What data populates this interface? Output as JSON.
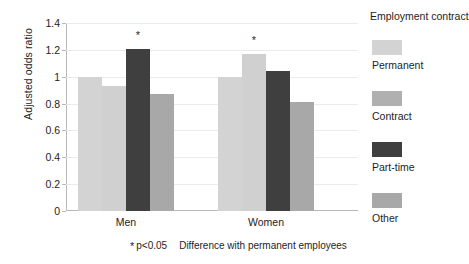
{
  "chart_data": {
    "type": "bar",
    "title": "",
    "xlabel": "",
    "ylabel": "Adjusted odds ratio",
    "ylim": [
      0,
      1.4
    ],
    "yticks": [
      "0",
      "0.2",
      "0.4",
      "0.6",
      "0.8",
      "1",
      "1.2",
      "1.4"
    ],
    "ytick_values": [
      0,
      0.2,
      0.4,
      0.6,
      0.8,
      1.0,
      1.2,
      1.4
    ],
    "grid": true,
    "legend_position": "right",
    "legend_title": "Employment contract",
    "categories": [
      "Men",
      "Women"
    ],
    "series": [
      {
        "name": "Permanent",
        "color": "#d3d3d3",
        "values": [
          1.0,
          1.0
        ],
        "significant": [
          false,
          false
        ]
      },
      {
        "name": "Contract",
        "color": "#d0d0d0",
        "values": [
          0.93,
          1.17
        ],
        "significant": [
          false,
          true
        ]
      },
      {
        "name": "Part-time",
        "color": "#3f3f3f",
        "values": [
          1.21,
          1.04
        ],
        "significant": [
          true,
          false
        ]
      },
      {
        "name": "Other",
        "color": "#a8a8a8",
        "values": [
          0.87,
          0.81
        ],
        "significant": [
          false,
          false
        ]
      }
    ],
    "significance_marker": "*",
    "footnote_marker": "*",
    "footnote_p": "p<0.05",
    "footnote_text": "Difference with permanent employees"
  },
  "legend": {
    "title": "Employment contract",
    "items": [
      {
        "label": "Permanent",
        "swatch": "#d3d3d3"
      },
      {
        "label": "Contract",
        "swatch": "#b0b0b0"
      },
      {
        "label": "Part-time",
        "swatch": "#3f3f3f"
      },
      {
        "label": "Other",
        "swatch": "#a8a8a8"
      }
    ]
  },
  "footnote": {
    "marker": "*",
    "p_value": "p<0.05",
    "text": "Difference with permanent employees"
  }
}
